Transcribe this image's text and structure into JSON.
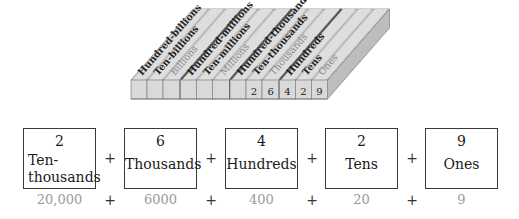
{
  "place_value_chart": {
    "columns": [
      {
        "label": "Hundred-billions",
        "digit": "",
        "style": "dark"
      },
      {
        "label": "Ten-billions",
        "digit": "",
        "style": "dark"
      },
      {
        "label": "Billions",
        "digit": "",
        "style": "light"
      },
      {
        "label": "Hundred-millions",
        "digit": "",
        "style": "dark"
      },
      {
        "label": "Ten-millions",
        "digit": "",
        "style": "dark"
      },
      {
        "label": "Millions",
        "digit": "",
        "style": "light"
      },
      {
        "label": "Hundred-thousands",
        "digit": "",
        "style": "dark"
      },
      {
        "label": "Ten-thousands",
        "digit": "2",
        "style": "dark"
      },
      {
        "label": "Thousands",
        "digit": "6",
        "style": "light"
      },
      {
        "label": "Hundreds",
        "digit": "4",
        "style": "dark"
      },
      {
        "label": "Tens",
        "digit": "2",
        "style": "dark"
      },
      {
        "label": "Ones",
        "digit": "9",
        "style": "light"
      }
    ],
    "colors": {
      "top_surface": "#cfcfcf",
      "front_face": "#d9d9d9",
      "side_face": "#bdbdbd",
      "dark_text": "#222222",
      "light_text": "#8a8a8a"
    }
  },
  "expanded_form": {
    "boxes": [
      {
        "digit": "2",
        "label_line1": "Ten-",
        "label_line2": "thousands",
        "value": "20,000"
      },
      {
        "digit": "6",
        "label_line1": "Thousands",
        "label_line2": "",
        "value": "6000"
      },
      {
        "digit": "4",
        "label_line1": "Hundreds",
        "label_line2": "",
        "value": "400"
      },
      {
        "digit": "2",
        "label_line1": "Tens",
        "label_line2": "",
        "value": "20"
      },
      {
        "digit": "9",
        "label_line1": "Ones",
        "label_line2": "",
        "value": "9"
      }
    ],
    "operator": "+"
  }
}
